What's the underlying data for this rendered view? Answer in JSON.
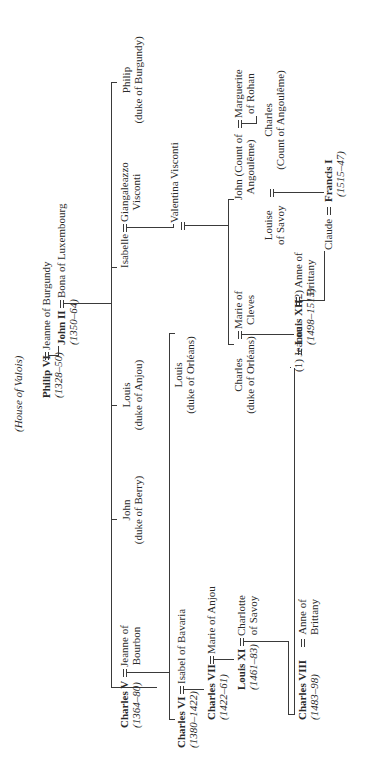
{
  "title": "(House of Valois)",
  "symbols": {
    "marriage": "═"
  },
  "people": {
    "philip_vi": {
      "name": "Philip VI",
      "reign": "(1328–50)"
    },
    "jeanne_burgundy": {
      "name": "Jeanne of Burgundy"
    },
    "john_ii": {
      "name": "John II",
      "reign": "(1350–64)"
    },
    "bona_luxembourg": {
      "name": "Bona of Luxembourg"
    },
    "philip_burgundy": {
      "name": "Philip",
      "title": "(duke of Burgundy)"
    },
    "isabelle": {
      "name": "Isabelle"
    },
    "giangaleazzo": {
      "name": "Giangaleazzo",
      "name2": "Visconti"
    },
    "louis_anjou": {
      "name": "Louis",
      "title": "(duke of Anjou)"
    },
    "john_berry": {
      "name": "John",
      "title": "(duke of Berry)"
    },
    "charles_v": {
      "name": "Charles V",
      "reign": "(1364–80)"
    },
    "jeanne_bourbon": {
      "name": "Jeanne of",
      "name2": "Bourbon"
    },
    "valentina": {
      "name": "Valentina Visconti"
    },
    "louis_orleans": {
      "name": "Louis",
      "title": "(duke of Orléans)"
    },
    "charles_vi": {
      "name": "Charles VI",
      "reign": "(1380–1422)"
    },
    "isabel_bavaria": {
      "name": "Isabel of Bavaria"
    },
    "charles_vii": {
      "name": "Charles VII",
      "reign": "(1422–61)"
    },
    "marie_anjou": {
      "name": "Marie of Anjou"
    },
    "louis_xi": {
      "name": "Louis XI",
      "reign": "(1461–83)"
    },
    "charlotte_savoy": {
      "name": "Charlotte",
      "name2": "of Savoy"
    },
    "charles_orleans": {
      "name": "Charles",
      "title": "(duke of Orléans)"
    },
    "marie_cleves": {
      "name": "Marie of",
      "name2": "Cleves"
    },
    "john_angouleme": {
      "name": "John (Count of",
      "name2": "Angoulême)"
    },
    "marguerite_rohan": {
      "name": "Marguerite",
      "name2": "of Rohan"
    },
    "charles_angouleme": {
      "name": "Charles",
      "title": "(Count of Angoulême)"
    },
    "louise_savoy": {
      "name": "Louise",
      "name2": "of Savoy"
    },
    "jeanne": {
      "name": "(1) Jeanne"
    },
    "louis_xii": {
      "name": "Louis XII",
      "reign": "(1498–1515)"
    },
    "anne_brittany_2": {
      "name": "(2) Anne of",
      "name2": "Brittany"
    },
    "charles_viii": {
      "name": "Charles VIII",
      "reign": "(1483–98)"
    },
    "anne_brittany": {
      "name": "Anne of",
      "name2": "Brittany"
    },
    "claude": {
      "name": "Claude"
    },
    "francis_i": {
      "name": "Francis I",
      "reign": "(1515–47)"
    }
  }
}
